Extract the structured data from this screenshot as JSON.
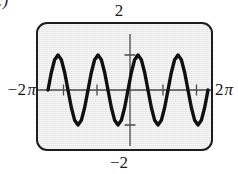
{
  "figure": {
    "part_label": "c)",
    "labels": {
      "y_max": "2",
      "y_min": "−2",
      "x_min_number": "−2",
      "x_min_unit": "π",
      "x_max_number": "2",
      "x_max_unit": "π"
    },
    "colors": {
      "screen_fill": "#e3e3e3",
      "screen_border": "#1d1d1d",
      "curve": "#111111",
      "axis": "#4a4a4a",
      "text": "#1a1a1a",
      "page_background": "#ffffff"
    }
  },
  "chart_data": {
    "type": "line",
    "title": "",
    "subtitle": "",
    "xlabel": "",
    "ylabel": "",
    "xlim": [
      -6.283185307,
      6.283185307
    ],
    "ylim": [
      -2,
      2
    ],
    "xtick_labels": [
      "−2π",
      "2π"
    ],
    "ytick_labels": [
      "2",
      "−2"
    ],
    "xticks": [
      -4.71238898,
      -1.570796327,
      1.570796327,
      4.71238898
    ],
    "yticks": [
      -1,
      1
    ],
    "grid": false,
    "legend": null,
    "legend_position": "none",
    "annotations": [],
    "series": [
      {
        "name": "y = sin(2x)",
        "equation": "y = sin(2x)",
        "amplitude": 1,
        "period": 3.141592654,
        "cycles_shown": 4,
        "x": [
          -6.283185307,
          -6.021385919,
          -5.759586532,
          -5.497787144,
          -5.235987756,
          -4.974188368,
          -4.71238898,
          -4.450589593,
          -4.188790205,
          -3.926990817,
          -3.665191429,
          -3.403392041,
          -3.141592654,
          -2.879793266,
          -2.617993878,
          -2.35619449,
          -2.094395102,
          -1.832595715,
          -1.570796327,
          -1.308996939,
          -1.047197551,
          -0.785398163,
          -0.523598776,
          -0.261799388,
          0.0,
          0.261799388,
          0.523598776,
          0.785398163,
          1.047197551,
          1.308996939,
          1.570796327,
          1.832595715,
          2.094395102,
          2.35619449,
          2.617993878,
          2.879793266,
          3.141592654,
          3.403392041,
          3.665191429,
          3.926990817,
          4.188790205,
          4.450589593,
          4.71238898,
          4.974188368,
          5.235987756,
          5.497787144,
          5.759586532,
          6.021385919,
          6.283185307
        ],
        "y": [
          0.0,
          0.5,
          0.866,
          1.0,
          0.866,
          0.5,
          0.0,
          -0.5,
          -0.866,
          -1.0,
          -0.866,
          -0.5,
          0.0,
          0.5,
          0.866,
          1.0,
          0.866,
          0.5,
          0.0,
          -0.5,
          -0.866,
          -1.0,
          -0.866,
          -0.5,
          0.0,
          0.5,
          0.866,
          1.0,
          0.866,
          0.5,
          0.0,
          -0.5,
          -0.866,
          -1.0,
          -0.866,
          -0.5,
          0.0,
          0.5,
          0.866,
          1.0,
          0.866,
          0.5,
          0.0,
          -0.5,
          -0.866,
          -1.0,
          -0.866,
          -0.5,
          0.0
        ]
      }
    ]
  }
}
